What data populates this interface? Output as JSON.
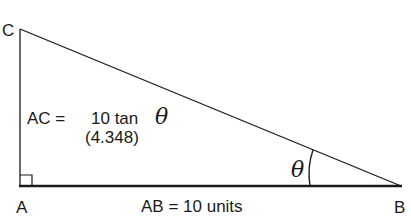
{
  "diagram": {
    "type": "right-triangle",
    "vertices": {
      "A": {
        "label": "A",
        "x": 20,
        "y": 186
      },
      "B": {
        "label": "B",
        "x": 401,
        "y": 186
      },
      "C": {
        "label": "C",
        "x": 20,
        "y": 29
      }
    },
    "right_angle_at": "A",
    "angle_label": "θ",
    "sides": {
      "AC": {
        "prefix": "AC =",
        "expr_text": "10 tan",
        "expr_symbol": "θ",
        "value": "(4.348)"
      },
      "AB": {
        "text": "AB = 10 units"
      }
    },
    "colors": {
      "stroke": "#1a1a1a",
      "background": "#ffffff"
    }
  }
}
